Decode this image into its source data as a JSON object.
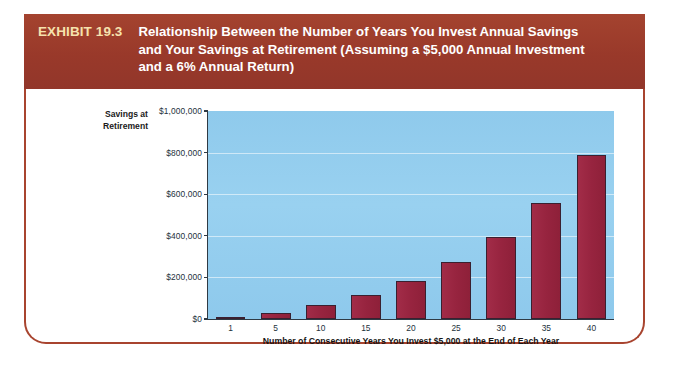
{
  "exhibit": {
    "label": "EXHIBIT 19.3",
    "title_lines": [
      "Relationship Between the Number of Years You Invest Annual Savings",
      "and Your Savings at Retirement (Assuming a $5,000 Annual Investment",
      "and a 6% Annual Return)"
    ],
    "header_bg": "#9d3f2d",
    "label_color": "#f6e2ad",
    "frame_border_color": "#a8442f"
  },
  "chart_data": {
    "type": "bar",
    "title": "Relationship Between the Number of Years You Invest Annual Savings and Your Savings at Retirement (Assuming a $5,000 Annual Investment and a 6% Annual Return)",
    "xlabel": "Number of Consecutive Years You Invest $5,000 at the End of Each Year",
    "ylabel": "Savings at Retirement",
    "ylabel_lines": [
      "Savings at",
      "Retirement"
    ],
    "categories": [
      "1",
      "5",
      "10",
      "15",
      "20",
      "25",
      "30",
      "35",
      "40"
    ],
    "values": [
      5000,
      28000,
      66000,
      116000,
      184000,
      274000,
      395000,
      560000,
      790000
    ],
    "ylim": [
      0,
      1000000
    ],
    "ytick_labels": [
      "$1,000,000",
      "$800,000",
      "$600,000",
      "$400,000",
      "$200,000",
      "$0"
    ],
    "ytick_values": [
      1000000,
      800000,
      600000,
      400000,
      200000,
      0
    ],
    "grid": true,
    "legend": null,
    "bar_color": "#9c2743",
    "plot_background": "#93cdee"
  }
}
